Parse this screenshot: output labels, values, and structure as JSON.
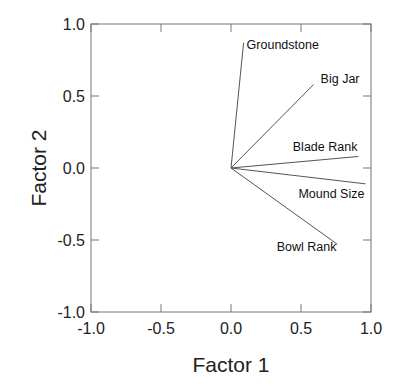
{
  "chart_data": {
    "type": "scatter",
    "subtype": "loading-vectors",
    "title": "",
    "xlabel": "Factor 1",
    "ylabel": "Factor 2",
    "xlim": [
      -1.0,
      1.0
    ],
    "ylim": [
      -1.0,
      1.0
    ],
    "xticks": [
      "-1.0",
      "-0.5",
      "0.0",
      "0.5",
      "1.0"
    ],
    "yticks": [
      "1.0",
      "0.5",
      "0.0",
      "-0.5",
      "-1.0"
    ],
    "grid": false,
    "legend": null,
    "origin": [
      0,
      0
    ],
    "series": [
      {
        "name": "Groundstone",
        "x": 0.09,
        "y": 0.87
      },
      {
        "name": "Big Jar",
        "x": 0.59,
        "y": 0.58
      },
      {
        "name": "Blade Rank",
        "x": 0.91,
        "y": 0.08
      },
      {
        "name": "Mound Size",
        "x": 0.96,
        "y": -0.11
      },
      {
        "name": "Bowl Rank",
        "x": 0.76,
        "y": -0.53
      }
    ]
  }
}
